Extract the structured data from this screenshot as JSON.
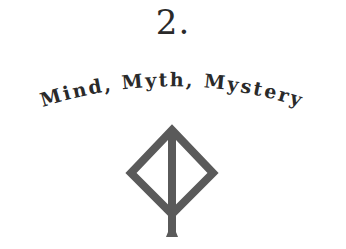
{
  "chapter": {
    "number": "2.",
    "title": "Mind, Myth, Mystery"
  },
  "emblem": {
    "icon": "rune-diamond-stem-icon",
    "color": "#5a5a5a"
  }
}
